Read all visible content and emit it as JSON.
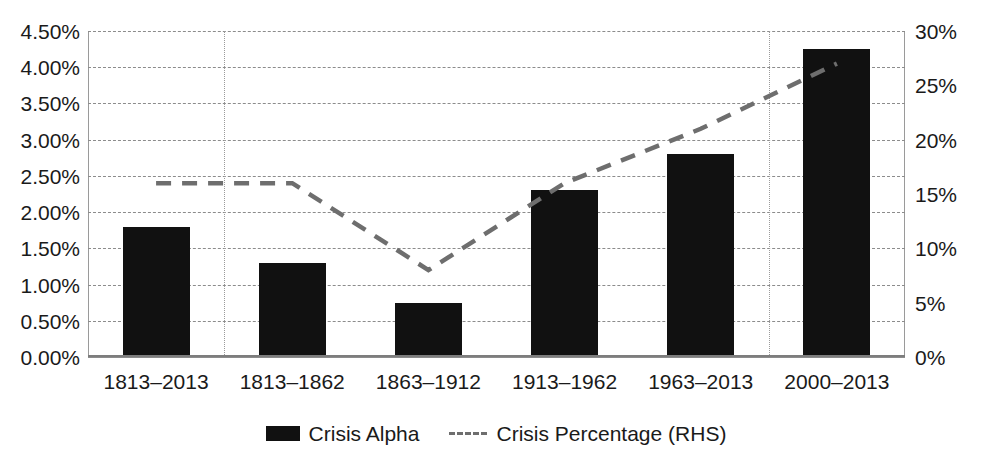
{
  "chart_data": {
    "type": "bar",
    "title": "",
    "subtitle": "",
    "xlabel": "",
    "ylabel": "",
    "categories": [
      "1813–2013",
      "1813–1862",
      "1863–1912",
      "1913–1962",
      "1963–2013",
      "2000–2013"
    ],
    "series": [
      {
        "name": "Crisis Alpha",
        "type": "bar",
        "axis": "left",
        "color": "#111111",
        "values": [
          1.8,
          1.3,
          0.75,
          2.3,
          2.8,
          4.25
        ]
      },
      {
        "name": "Crisis Percentage (RHS)",
        "type": "line",
        "axis": "right",
        "color": "#6e6e6e",
        "style": "dashed",
        "values": [
          16,
          16,
          8,
          16,
          21,
          27
        ]
      }
    ],
    "left_axis": {
      "label": "",
      "min": 0.0,
      "max": 4.5,
      "step": 0.5,
      "ticks": [
        "0.00%",
        "0.50%",
        "1.00%",
        "1.50%",
        "2.00%",
        "2.50%",
        "3.00%",
        "3.50%",
        "4.00%",
        "4.50%"
      ],
      "tick_values": [
        0.0,
        0.5,
        1.0,
        1.5,
        2.0,
        2.5,
        3.0,
        3.5,
        4.0,
        4.5
      ]
    },
    "right_axis": {
      "label": "",
      "min": 0,
      "max": 30,
      "step": 5,
      "ticks": [
        "0%",
        "5%",
        "10%",
        "15%",
        "20%",
        "25%",
        "30%"
      ],
      "tick_values": [
        0,
        5,
        10,
        15,
        20,
        25,
        30
      ]
    },
    "grid": {
      "horizontal": true,
      "vertical_separators_after_categories": [
        1,
        5
      ]
    },
    "legend": {
      "position": "bottom",
      "entries": [
        {
          "label": "Crisis Alpha",
          "marker": "bar-swatch"
        },
        {
          "label": "Crisis Percentage (RHS)",
          "marker": "dashed-line"
        }
      ]
    }
  }
}
